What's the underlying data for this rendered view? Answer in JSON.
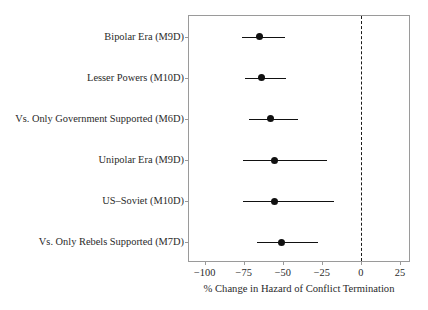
{
  "chart_data": {
    "type": "scatter",
    "subtype": "forest-plot",
    "title": "",
    "xlabel": "% Change in Hazard of Conflict Termination",
    "ylabel": "",
    "xlim": [
      -110,
      32
    ],
    "xticks": [
      -100,
      -75,
      -50,
      -25,
      0,
      25
    ],
    "xticklabels": [
      "−100",
      "−75",
      "−50",
      "−25",
      "0",
      "25"
    ],
    "grid": false,
    "legend": null,
    "reference_line": {
      "value": 0,
      "style": "dashed",
      "color": "#1a1a1a"
    },
    "categories": [
      "Bipolar Era (M9D)",
      "Lesser Powers (M10D)",
      "Vs. Only Government Supported (M6D)",
      "Unipolar Era (M9D)",
      "US–Soviet (M10D)",
      "Vs. Only Rebels Supported (M7D)"
    ],
    "points": [
      {
        "label": "Bipolar Era (M9D)",
        "estimate": -64.9,
        "ci_low": -76.2,
        "ci_high": -48.8
      },
      {
        "label": "Lesser Powers (M10D)",
        "estimate": -63.7,
        "ci_low": -74.4,
        "ci_high": -48.2
      },
      {
        "label": "Vs. Only Government Supported (M6D)",
        "estimate": -57.7,
        "ci_low": -71.4,
        "ci_high": -40.5
      },
      {
        "label": "Unipolar Era (M9D)",
        "estimate": -55.4,
        "ci_low": -75.6,
        "ci_high": -22.0
      },
      {
        "label": "US–Soviet (M10D)",
        "estimate": -55.4,
        "ci_low": -75.6,
        "ci_high": -17.3
      },
      {
        "label": "Vs. Only Rebels Supported (M7D)",
        "estimate": -50.6,
        "ci_low": -66.7,
        "ci_high": -27.4
      }
    ],
    "marker_color": "#111111",
    "line_color": "#111111",
    "frame_color": "#9a9a9a"
  }
}
